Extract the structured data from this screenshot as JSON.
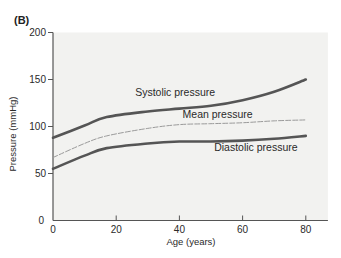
{
  "figure": {
    "panel_label": "(B)"
  },
  "chart_data": {
    "type": "line",
    "title": "",
    "xlabel": "Age (years)",
    "ylabel": "Pressure (mmHg)",
    "xlim": [
      0,
      87
    ],
    "ylim": [
      0,
      200
    ],
    "xticks": [
      0,
      20,
      40,
      60,
      80
    ],
    "yticks": [
      0,
      50,
      100,
      150,
      200
    ],
    "grid": false,
    "legend": "inline labels",
    "x": [
      0,
      10,
      17,
      30,
      40,
      50,
      60,
      70,
      80
    ],
    "series": [
      {
        "name": "Systolic pressure",
        "style": "solid",
        "values": [
          88,
          101,
          110,
          116,
          119,
          122,
          128,
          137,
          150
        ],
        "label_pos": {
          "age": 26,
          "value": 132
        }
      },
      {
        "name": "Mean pressure",
        "style": "dashed",
        "values": [
          67,
          82,
          90,
          98,
          102,
          103,
          104,
          106,
          107
        ],
        "label_pos": {
          "age": 41,
          "value": 109
        }
      },
      {
        "name": "Diastolic pressure",
        "style": "solid",
        "values": [
          55,
          69,
          77,
          82,
          84,
          84,
          85,
          87,
          90
        ],
        "label_pos": {
          "age": 51,
          "value": 74
        }
      }
    ]
  },
  "colors": {
    "plot_background": "#f2f2f0",
    "axis": "#555555",
    "solid_line": "#555555",
    "dashed_line": "#9a9a9a",
    "text": "#2a2a2a"
  }
}
